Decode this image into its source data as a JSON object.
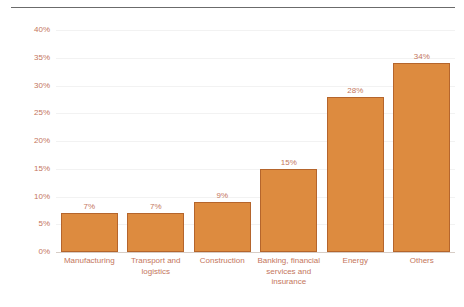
{
  "chart_data": {
    "type": "bar",
    "title": "",
    "subtitle": "",
    "xlabel": "",
    "ylabel": "Revenue share",
    "categories": [
      "Manufacturing",
      "Transport and logistics",
      "Construction",
      "Banking, financial services and insurance",
      "Energy",
      "Others"
    ],
    "values": [
      7,
      7,
      9,
      15,
      28,
      34
    ],
    "value_labels": [
      "7%",
      "7%",
      "9%",
      "15%",
      "28%",
      "34%"
    ],
    "ylim": [
      0,
      40
    ],
    "ytick_values": [
      0,
      5,
      10,
      15,
      20,
      25,
      30,
      35,
      40
    ],
    "ytick_labels": [
      "0%",
      "5%",
      "10%",
      "15%",
      "20%",
      "25%",
      "30%",
      "35%",
      "40%"
    ],
    "grid": true,
    "legend": null,
    "legend_position": "none",
    "colors": {
      "bar_fill": "#dd8b3f",
      "bar_border": "#b5652c",
      "text": "#c4765c",
      "gridline": "#f2f2f2",
      "axis": "#d7cdc6",
      "top_rule": "#6b6b6b"
    }
  }
}
